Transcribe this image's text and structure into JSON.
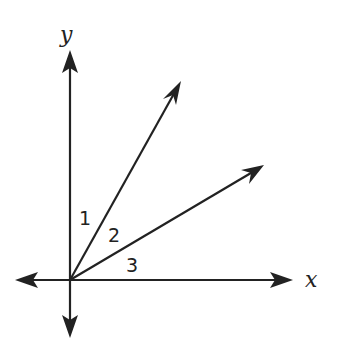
{
  "diagram": {
    "type": "angles-at-origin",
    "axes": {
      "x_label": "x",
      "y_label": "y"
    },
    "rays": [
      {
        "name": "upper-ray",
        "description": "ray from origin into first quadrant, steeper"
      },
      {
        "name": "lower-ray",
        "description": "ray from origin into first quadrant, shallower"
      }
    ],
    "angle_labels": [
      "1",
      "2",
      "3"
    ],
    "angles": [
      {
        "label": "1",
        "between": "y-axis and upper ray"
      },
      {
        "label": "2",
        "between": "upper ray and lower ray"
      },
      {
        "label": "3",
        "between": "lower ray and x-axis"
      }
    ],
    "colors": {
      "stroke": "#222222",
      "background": "#ffffff"
    }
  }
}
